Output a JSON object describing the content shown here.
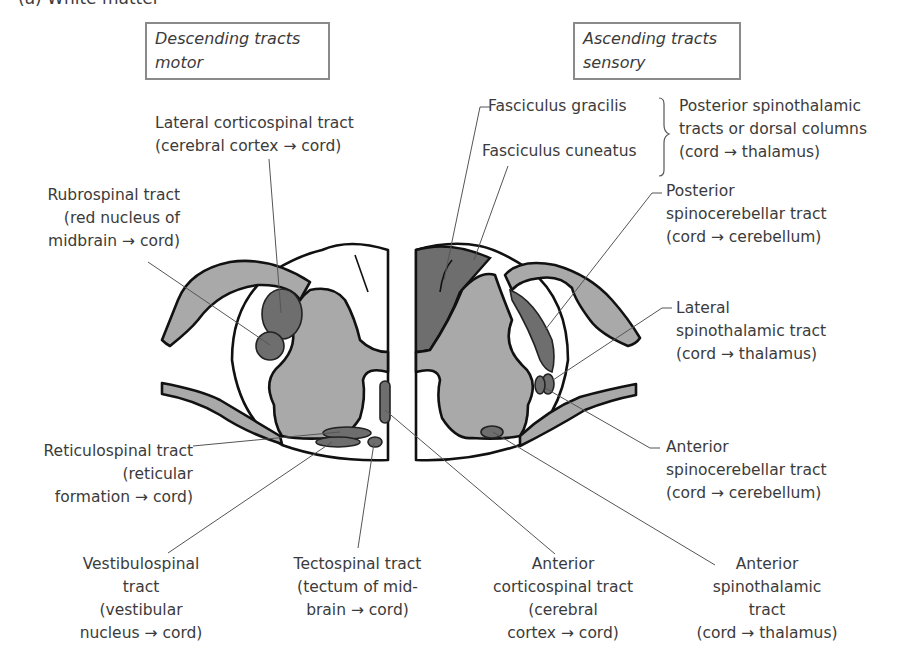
{
  "figure": {
    "title": "(a)  White matter",
    "descending_box": {
      "line1": "Descending tracts",
      "line2": "motor"
    },
    "ascending_box": {
      "line1": "Ascending tracts",
      "line2": "sensory"
    }
  },
  "descending_labels": {
    "lateral_corticospinal": "Lateral corticospinal tract\n(cerebral cortex → cord)",
    "rubrospinal": "Rubrospinal tract\n(red nucleus of\nmidbrain → cord)",
    "reticulospinal": "Reticulospinal tract\n(reticular\nformation → cord)",
    "vestibulospinal": "Vestibulospinal\ntract\n(vestibular\nnucleus → cord)",
    "tectospinal": "Tectospinal tract\n(tectum of mid-\nbrain → cord)",
    "anterior_corticospinal": "Anterior\ncorticospinal tract\n(cerebral\ncortex → cord)"
  },
  "ascending_labels": {
    "fasciculus_gracilis": "Fasciculus gracilis",
    "fasciculus_cuneatus": "Fasciculus cuneatus",
    "posterior_spinothalamic": "Posterior spinothalamic\ntracts or dorsal columns\n(cord → thalamus)",
    "posterior_spinocerebellar": "Posterior\nspinocerebellar tract\n(cord → cerebellum)",
    "lateral_spinothalamic": "Lateral\nspinothalamic tract\n(cord → thalamus)",
    "anterior_spinocerebellar": "Anterior\nspinocerebellar tract\n(cord → cerebellum)",
    "anterior_spinothalamic": "Anterior\nspinothalamic\ntract\n(cord → thalamus)"
  },
  "colors": {
    "grey_matter": "#a9a9a9",
    "tract_fill": "#6e6e6e",
    "outline": "#111111",
    "box_border": "#8a8a8a"
  }
}
